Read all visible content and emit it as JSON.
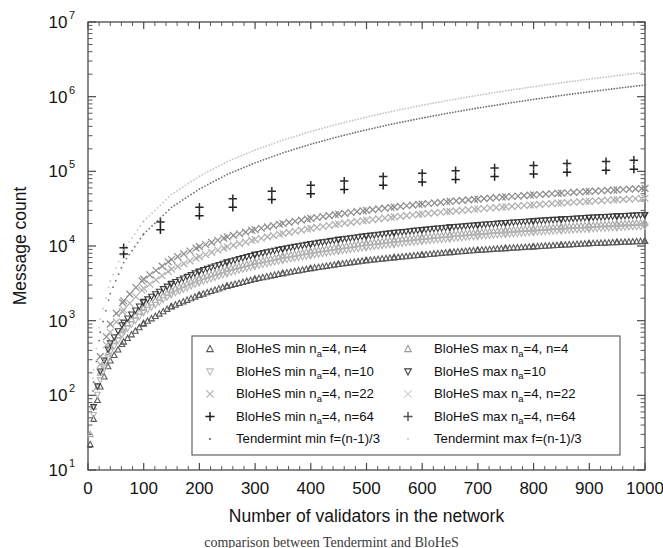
{
  "chart_data": {
    "type": "scatter",
    "title": "",
    "xlabel": "Number of validators in the network",
    "ylabel": "Message count",
    "xlim": [
      0,
      1000
    ],
    "ylim": [
      10,
      10000000
    ],
    "yscale": "log",
    "xscale": "linear",
    "grid": false,
    "legend_position": "lower-center-inside",
    "xticks": [
      "0",
      "100",
      "200",
      "300",
      "400",
      "500",
      "600",
      "700",
      "800",
      "900",
      "1000"
    ],
    "xtick_values": [
      0,
      100,
      200,
      300,
      400,
      500,
      600,
      700,
      800,
      900,
      1000
    ],
    "yticks": [
      "10^1",
      "10^2",
      "10^3",
      "10^4",
      "10^5",
      "10^6",
      "10^7"
    ],
    "ytick_mantissa": "10",
    "ytick_exponents": [
      "1",
      "2",
      "3",
      "4",
      "5",
      "6",
      "7"
    ],
    "series": [
      {
        "name": "BloHeS min n_a=4, n=4",
        "marker": "triangle-up",
        "color": "#5a5a5a",
        "x": [
          4,
          10,
          22,
          40,
          64,
          100,
          150,
          200,
          250,
          300,
          350,
          400,
          450,
          500,
          550,
          600,
          650,
          700,
          750,
          800,
          850,
          900,
          950,
          1000
        ],
        "y": [
          22,
          48,
          130,
          290,
          520,
          920,
          1550,
          2200,
          2900,
          3600,
          4300,
          5000,
          5700,
          6400,
          7000,
          7600,
          8200,
          8800,
          9300,
          9800,
          10300,
          10800,
          11200,
          11600
        ]
      },
      {
        "name": "BloHeS max n_a=4, n=4",
        "marker": "triangle-up",
        "color": "#a8a8a8",
        "x": [
          4,
          10,
          22,
          40,
          64,
          100,
          150,
          200,
          250,
          300,
          350,
          400,
          450,
          500,
          550,
          600,
          650,
          700,
          750,
          800,
          850,
          900,
          950,
          1000
        ],
        "y": [
          30,
          70,
          200,
          450,
          820,
          1500,
          2550,
          3700,
          4900,
          6100,
          7300,
          8500,
          9700,
          10900,
          12000,
          13100,
          14200,
          15200,
          16200,
          17100,
          18000,
          18900,
          19700,
          20500
        ]
      },
      {
        "name": "BloHeS min n_a=4, n=10",
        "marker": "triangle-down",
        "color": "#b4b4b4",
        "x": [
          10,
          22,
          40,
          64,
          100,
          150,
          200,
          250,
          300,
          350,
          400,
          450,
          500,
          550,
          600,
          650,
          700,
          750,
          800,
          850,
          900,
          950,
          1000
        ],
        "y": [
          55,
          160,
          380,
          700,
          1300,
          2250,
          3250,
          4300,
          5400,
          6450,
          7500,
          8550,
          9600,
          10600,
          11600,
          12550,
          13500,
          14400,
          15250,
          16100,
          16900,
          17700,
          18400
        ]
      },
      {
        "name": "BloHeS max n_a=4, n=10",
        "marker": "triangle-down",
        "color": "#3d3d3d",
        "x": [
          10,
          22,
          40,
          64,
          100,
          150,
          200,
          250,
          300,
          350,
          400,
          450,
          500,
          550,
          600,
          650,
          700,
          750,
          800,
          850,
          900,
          950,
          1000
        ],
        "y": [
          70,
          210,
          500,
          950,
          1800,
          3150,
          4600,
          6100,
          7700,
          9200,
          10700,
          12200,
          13700,
          15100,
          16500,
          17900,
          19200,
          20500,
          21700,
          22900,
          24100,
          25200,
          26200
        ]
      },
      {
        "name": "BloHeS min n_a=4, n=22",
        "marker": "cross-x",
        "color": "#b0b0b0",
        "x": [
          22,
          40,
          64,
          100,
          150,
          200,
          250,
          300,
          350,
          400,
          450,
          500,
          550,
          600,
          650,
          700,
          750,
          800,
          850,
          900,
          950,
          1000
        ],
        "y": [
          260,
          700,
          1400,
          2700,
          4900,
          7200,
          9700,
          12200,
          14700,
          17200,
          19700,
          22100,
          24500,
          26800,
          29100,
          31300,
          33500,
          35600,
          37700,
          39700,
          41700,
          43600
        ]
      },
      {
        "name": "BloHeS max n_a=4, n=22",
        "marker": "cross-x",
        "color": "#8e8e8e",
        "x": [
          22,
          40,
          64,
          100,
          150,
          200,
          250,
          300,
          350,
          400,
          450,
          500,
          550,
          600,
          650,
          700,
          750,
          800,
          850,
          900,
          950,
          1000
        ],
        "y": [
          330,
          900,
          1850,
          3600,
          6600,
          9800,
          13200,
          16600,
          20000,
          23400,
          26700,
          30000,
          33200,
          36400,
          39500,
          42500,
          45400,
          48300,
          51100,
          53800,
          56500,
          59100
        ]
      },
      {
        "name": "BloHeS min n_a=4, n=64",
        "marker": "plus",
        "color": "#1f1f1f",
        "x": [
          64,
          130,
          200,
          260,
          330,
          400,
          460,
          530,
          600,
          660,
          730,
          800,
          860,
          930,
          980
        ],
        "y": [
          7800,
          16500,
          25500,
          33000,
          42000,
          50000,
          57000,
          65000,
          72000,
          78000,
          85000,
          92000,
          97000,
          103000,
          107000
        ]
      },
      {
        "name": "BloHeS max n_a=4, n=64",
        "marker": "plus",
        "color": "#2b2b2b",
        "x": [
          64,
          130,
          200,
          260,
          330,
          400,
          460,
          530,
          600,
          660,
          730,
          800,
          860,
          930,
          980
        ],
        "y": [
          9500,
          21000,
          33000,
          43000,
          54000,
          65000,
          74000,
          85000,
          94000,
          102000,
          111000,
          120000,
          127000,
          135000,
          141000
        ]
      },
      {
        "name": "Tendermint min f=(n-1)/3",
        "marker": "dot",
        "color": "#6e6e6e",
        "x": [
          4,
          10,
          22,
          40,
          64,
          100,
          150,
          200,
          250,
          300,
          350,
          400,
          450,
          500,
          550,
          600,
          650,
          700,
          750,
          800,
          850,
          900,
          950,
          1000
        ],
        "y": [
          30,
          150,
          700,
          2300,
          6000,
          14500,
          33000,
          58000,
          91000,
          130000,
          177000,
          231000,
          292000,
          360000,
          436000,
          518000,
          608000,
          705000,
          809000,
          920000,
          1038000,
          1163000,
          1295000,
          1434000
        ]
      },
      {
        "name": "Tendermint max f=(n-1)/3",
        "marker": "dot",
        "color": "#c4c4c4",
        "x": [
          4,
          10,
          22,
          40,
          64,
          100,
          150,
          200,
          250,
          300,
          350,
          400,
          450,
          500,
          550,
          600,
          650,
          700,
          750,
          800,
          850,
          900,
          950,
          1000
        ],
        "y": [
          45,
          220,
          1050,
          3400,
          8800,
          21500,
          49000,
          86000,
          135000,
          193000,
          262000,
          342000,
          432000,
          533000,
          645000,
          767000,
          900000,
          1043000,
          1197000,
          1361000,
          1536000,
          1721000,
          1916000,
          2122000
        ]
      }
    ]
  },
  "legend": {
    "entries": [
      {
        "label_prefix": "BloHeS min n",
        "sub": "a",
        "label_suffix": "=4, n=4",
        "marker": "triangle-up",
        "color": "#5a5a5a"
      },
      {
        "label_prefix": "BloHeS min n",
        "sub": "a",
        "label_suffix": "=4, n=10",
        "marker": "triangle-down",
        "color": "#bdbdbd"
      },
      {
        "label_prefix": "BloHeS min n",
        "sub": "a",
        "label_suffix": "=4, n=22",
        "marker": "cross-x",
        "color": "#b4b4b4"
      },
      {
        "label_prefix": "BloHeS min n",
        "sub": "a",
        "label_suffix": "=4, n=64",
        "marker": "plus",
        "color": "#1f1f1f"
      },
      {
        "label_prefix": "Tendermint min f=(n-1)/3",
        "sub": "",
        "label_suffix": "",
        "marker": "dot",
        "color": "#4a4a4a"
      },
      {
        "label_prefix": "BloHeS max n",
        "sub": "a",
        "label_suffix": "=4, n=4",
        "marker": "triangle-up",
        "color": "#9a9a9a"
      },
      {
        "label_prefix": "BloHeS max n",
        "sub": "a",
        "label_suffix": "=10",
        "marker": "triangle-down",
        "color": "#3d3d3d"
      },
      {
        "label_prefix": "BloHeS max n",
        "sub": "a",
        "label_suffix": "=4, n=22",
        "marker": "cross-x",
        "color": "#cfcfcf"
      },
      {
        "label_prefix": "BloHeS max n",
        "sub": "a",
        "label_suffix": "=4, n=64",
        "marker": "plus",
        "color": "#555555"
      },
      {
        "label_prefix": "Tendermint max f=(n-1)/3",
        "sub": "",
        "label_suffix": "",
        "marker": "dot",
        "color": "#c0c0c0"
      }
    ],
    "labels_full": [
      "BloHeS min n_a=4, n=4",
      "BloHeS min n_a=4, n=10",
      "BloHeS min n_a=4, n=22",
      "BloHeS min n_a=4, n=64",
      "Tendermint min f=(n-1)/3",
      "BloHeS max n_a=4, n=4",
      "BloHeS max n_a=4, n=10",
      "BloHeS max n_a=4, n=22",
      "BloHeS max n_a=4, n=64",
      "Tendermint max f=(n-1)/3"
    ]
  },
  "caption": {
    "text": "comparison between Tendermint and BloHeS"
  },
  "colors": {
    "axis": "#4a4a4a",
    "text": "#141414",
    "legend_border": "#555555",
    "background": "#ffffff"
  }
}
